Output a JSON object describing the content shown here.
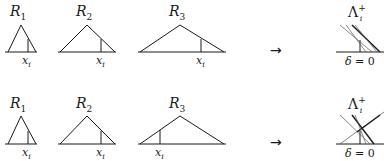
{
  "rows": [
    {
      "id": "top",
      "regions": [
        {
          "name": "R",
          "sub": "1",
          "xi_name": "x",
          "xi_sub": "i"
        },
        {
          "name": "R",
          "sub": "2",
          "xi_name": "x",
          "xi_sub": "i"
        },
        {
          "name": "R",
          "sub": "3",
          "xi_name": "x",
          "xi_sub": "i"
        }
      ],
      "arrow": "→",
      "result": {
        "lambda": "Λ",
        "lambda_sub": "i",
        "lambda_sup": "+",
        "delta_sym": "δ",
        "delta_eq": " = 0"
      }
    },
    {
      "id": "bottom",
      "regions": [
        {
          "name": "R",
          "sub": "1",
          "xi_name": "x",
          "xi_sub": "i"
        },
        {
          "name": "R",
          "sub": "2",
          "xi_name": "x",
          "xi_sub": "i"
        },
        {
          "name": "R",
          "sub": "3",
          "xi_name": "x",
          "xi_sub": "i"
        }
      ],
      "arrow": "→",
      "result": {
        "lambda": "Λ",
        "lambda_sub": "i",
        "lambda_sup": "+",
        "delta_sym": "δ",
        "delta_eq": " = 0"
      }
    }
  ],
  "colors": {
    "line": "#1a1a1a",
    "thin_line": "#555555",
    "background": "#ffffff"
  }
}
